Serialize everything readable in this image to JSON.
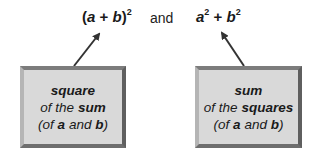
{
  "formulas": {
    "left": {
      "open": "(",
      "a": "a",
      "plus": " + ",
      "b": "b",
      "close": ")",
      "exp": "2"
    },
    "connector": "and",
    "right": {
      "a": "a",
      "a_exp": "2",
      "plus": " + ",
      "b": "b",
      "b_exp": "2"
    }
  },
  "boxes": {
    "left": {
      "line1": "square",
      "line2_pre": "of the ",
      "line2_bold": "sum",
      "line3_open": "(of ",
      "line3_a": "a",
      "line3_mid": " and ",
      "line3_b": "b",
      "line3_close": ")"
    },
    "right": {
      "line1": "sum",
      "line2_pre": "of the ",
      "line2_bold": "squares",
      "line3_open": "(of ",
      "line3_a": "a",
      "line3_mid": " and ",
      "line3_b": "b",
      "line3_close": ")"
    }
  },
  "colors": {
    "box_fill": "#d9d9d9",
    "box_border": "#6e6e6e",
    "arrow": "#333333",
    "text": "#1a1a1a"
  }
}
